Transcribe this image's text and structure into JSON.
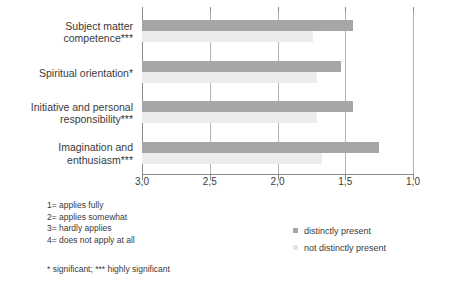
{
  "chart_data": {
    "type": "bar",
    "orientation": "horizontal",
    "title": "",
    "xlabel": "",
    "ylabel": "",
    "xlim": [
      3.0,
      1.0
    ],
    "x_axis_reversed": true,
    "grid": true,
    "legend_position": "bottom-right",
    "xticks": [
      "3,0",
      "2,5",
      "2,0",
      "1,5",
      "1,0"
    ],
    "xtick_values": [
      3.0,
      2.5,
      2.0,
      1.5,
      1.0
    ],
    "categories": [
      "Subject matter competence***",
      "Spiritual orientation*",
      "Initiative and personal responsibility***",
      "Imagination and enthusiasm***"
    ],
    "category_lines": [
      [
        "Subject matter",
        "competence***"
      ],
      [
        "Spiritual orientation*"
      ],
      [
        "Initiative and personal",
        "responsibility***"
      ],
      [
        "Imagination and",
        "enthusiasm***"
      ]
    ],
    "series": [
      {
        "name": "distinctly present",
        "color": "#a6a6a6",
        "values": [
          1.44,
          1.53,
          1.44,
          1.25
        ]
      },
      {
        "name": "not distinctly present",
        "color": "#ececec",
        "values": [
          1.74,
          1.71,
          1.71,
          1.67
        ]
      }
    ]
  },
  "legend": {
    "items": [
      {
        "label": "distinctly present",
        "color": "#a6a6a6"
      },
      {
        "label": "not distinctly present",
        "color": "#e4e4e4"
      }
    ]
  },
  "scale_key": {
    "lines": [
      "1= applies fully",
      "2= applies somewhat",
      "3= hardly applies",
      "4= does not apply at all"
    ]
  },
  "significance_note": "* significant;  *** highly significant"
}
